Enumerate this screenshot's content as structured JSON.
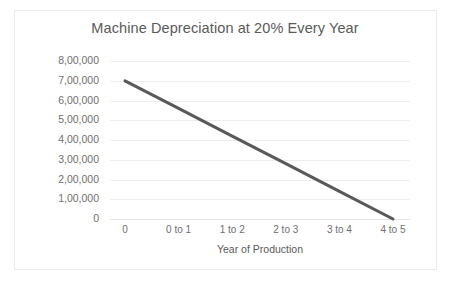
{
  "chart_data": {
    "type": "line",
    "title": "Machine Depreciation at 20% Every Year",
    "xlabel": "Year of Production",
    "ylabel": "Cost of Machine $",
    "categories": [
      "0",
      "0 to 1",
      "1 to 2",
      "2 to 3",
      "3 to 4",
      "4 to 5"
    ],
    "values": [
      700000,
      560000,
      420000,
      280000,
      140000,
      0
    ],
    "series": [
      {
        "name": "Cost of Machine",
        "values": [
          700000,
          560000,
          420000,
          280000,
          140000,
          0
        ],
        "color": "#595959"
      }
    ],
    "ylim": [
      0,
      800000
    ],
    "yticks": [
      0,
      100000,
      200000,
      300000,
      400000,
      500000,
      600000,
      700000,
      800000
    ],
    "ytick_labels": [
      "0",
      "1,00,000",
      "2,00,000",
      "3,00,000",
      "4,00,000",
      "5,00,000",
      "6,00,000",
      "7,00,000",
      "8,00,000"
    ],
    "grid": true,
    "legend": false,
    "legend_position": "none"
  },
  "figure": {
    "caption": ""
  },
  "colors": {
    "line": "#595959",
    "gridline": "#eeeeee",
    "axis": "#e2e2e2",
    "title_text": "#5a5a5a",
    "tick_text": "#6f6f6f",
    "frame_border": "#ebebeb",
    "background": "#ffffff"
  }
}
